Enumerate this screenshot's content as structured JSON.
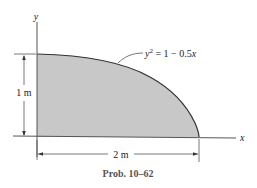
{
  "figure": {
    "caption": "Prob. 10–62",
    "region_fill": "#c8c8c8",
    "curve_label": {
      "y": "y",
      "sup": "2",
      "rhs": " = 1 − 0.5",
      "x": "x"
    },
    "axes": {
      "x_label": "x",
      "y_label": "y"
    },
    "dimensions": {
      "height": "1 m",
      "width": "2 m"
    }
  }
}
